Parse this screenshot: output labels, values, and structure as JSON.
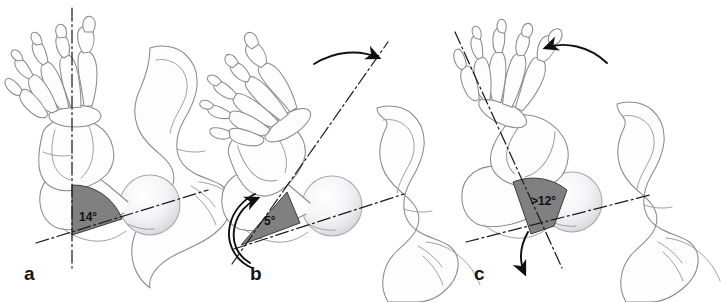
{
  "figure": {
    "background_color": "#ffffff",
    "bone_outline_color": "#8a8a90",
    "bone_fill_color": "#fdfdfd",
    "wedge_fill_color": "#808080",
    "wedge_stroke_color": "#3a3a3a",
    "axis_line_color": "#1d1d1d",
    "arrow_color": "#101010",
    "label_text_color": "#111111",
    "femoral_head_highlight": "#ffffff",
    "femoral_head_shade": "#e3e3e6"
  },
  "panels": [
    {
      "id": "a",
      "letter": "a",
      "angle_label": "14°",
      "angle_value": 14,
      "angle_comparator": "",
      "foot_rotation": "neutral",
      "tibial_axis_orientation": "vertical",
      "femoral_neck_axis_orientation": "oblique",
      "arrows": []
    },
    {
      "id": "b",
      "letter": "b",
      "angle_label": "5°",
      "angle_value": 5,
      "angle_comparator": "",
      "foot_rotation": "internal",
      "tibial_axis_orientation": "oblique-internal",
      "femoral_neck_axis_orientation": "oblique",
      "arrows": [
        {
          "name": "foot-rotation-arrow",
          "direction": "clockwise-right",
          "position": "top"
        },
        {
          "name": "limb-rotation-arrow",
          "direction": "counterclockwise-up",
          "position": "lower-left"
        }
      ]
    },
    {
      "id": "c",
      "letter": "c",
      "angle_label": ">12°",
      "angle_value": 12,
      "angle_comparator": ">",
      "foot_rotation": "external",
      "tibial_axis_orientation": "oblique-external",
      "femoral_neck_axis_orientation": "oblique",
      "arrows": [
        {
          "name": "foot-rotation-arrow",
          "direction": "counterclockwise-left",
          "position": "top"
        },
        {
          "name": "limb-rotation-arrow",
          "direction": "clockwise-down",
          "position": "bottom"
        }
      ]
    }
  ]
}
